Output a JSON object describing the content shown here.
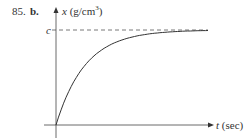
{
  "problem": {
    "number": "85.",
    "part": "b."
  },
  "chart_data": {
    "type": "line",
    "title": "",
    "xlabel": "t (sec)",
    "ylabel": "x (g/cm³)",
    "x_var": "t",
    "x_unit": "(sec)",
    "y_var": "x",
    "y_unit": "(g/cm",
    "y_unit_sup": "3",
    "y_unit_close": ")",
    "asymptote_label": "c",
    "asymptote": "dashed horizontal line at x = c",
    "series": [
      {
        "name": "x(t)",
        "x": [
          0,
          0.5,
          1,
          1.5,
          2,
          3,
          4,
          5
        ],
        "values": [
          0,
          0.39,
          0.63,
          0.78,
          0.86,
          0.95,
          0.98,
          0.99
        ]
      }
    ],
    "ylim": [
      0,
      1
    ],
    "grid": false
  }
}
